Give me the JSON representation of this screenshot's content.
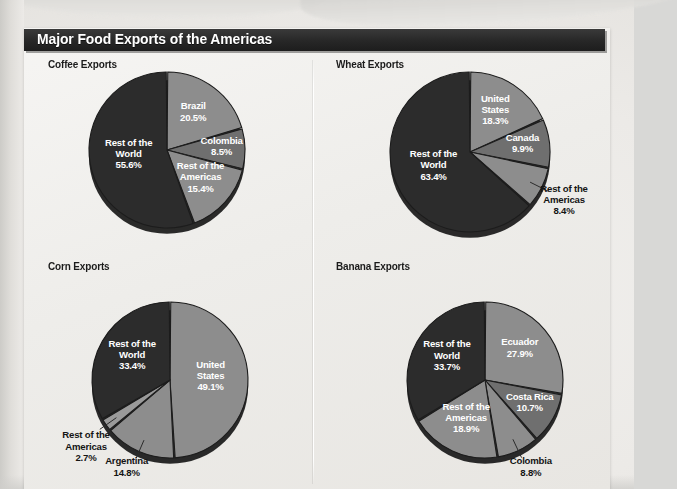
{
  "figure": {
    "title": "Major Food Exports of the Americas"
  },
  "palette": {
    "dark_slice": "#2c2c2c",
    "mid_slice": "#6f6f6f",
    "light_slice": "#8d8d8d",
    "lighter_slice": "#9a9a9a",
    "slice_edge": "#1c1c1c",
    "label_inside": "#ffffff",
    "label_outside": "#141414",
    "title_bar_bg": "#272727",
    "title_bar_text": "#ffffff",
    "paper_bg": "#efedea"
  },
  "chart_data": [
    {
      "id": "coffee",
      "type": "pie",
      "title": "Coffee Exports",
      "unit": "percent",
      "start_angle": 0,
      "categories": [
        "Brazil",
        "Colombia",
        "Rest of the Americas",
        "Rest of the World"
      ],
      "values": [
        20.5,
        8.5,
        15.4,
        55.6
      ],
      "labels": [
        "Brazil\n20.5%",
        "Colombia\n8.5%",
        "Rest of the\nAmericas\n15.4%",
        "Rest of the\nWorld\n55.6%"
      ],
      "slices": [
        {
          "name": "Brazil",
          "value": 20.5,
          "label": "Brazil",
          "pct": "20.5%",
          "color": "#8d8d8d",
          "label_pos": "inside",
          "label_r": 0.56
        },
        {
          "name": "Colombia",
          "value": 8.5,
          "label": "Colombia",
          "pct": "8.5%",
          "color": "#6f6f6f",
          "label_pos": "inside",
          "label_r": 0.7
        },
        {
          "name": "Rest of the Americas",
          "value": 15.4,
          "label": "Rest of the\nAmericas",
          "pct": "15.4%",
          "color": "#8d8d8d",
          "label_pos": "inside",
          "label_r": 0.58
        },
        {
          "name": "Rest of the World",
          "value": 55.6,
          "label": "Rest of the\nWorld",
          "pct": "55.6%",
          "color": "#2c2c2c",
          "label_pos": "inside",
          "label_r": 0.5
        }
      ]
    },
    {
      "id": "wheat",
      "type": "pie",
      "title": "Wheat Exports",
      "unit": "percent",
      "start_angle": 0,
      "categories": [
        "United States",
        "Canada",
        "Rest of the Americas",
        "Rest of the World"
      ],
      "values": [
        18.3,
        9.9,
        8.4,
        63.4
      ],
      "labels": [
        "United\nStates\n18.3%",
        "Canada\n9.9%",
        "Rest of the\nAmericas\n8.4%",
        "Rest of the\nWorld\n63.4%"
      ],
      "slices": [
        {
          "name": "United States",
          "value": 18.3,
          "label": "United\nStates",
          "pct": "18.3%",
          "color": "#8d8d8d",
          "label_pos": "inside",
          "label_r": 0.58
        },
        {
          "name": "Canada",
          "value": 9.9,
          "label": "Canada",
          "pct": "9.9%",
          "color": "#6f6f6f",
          "label_pos": "inside",
          "label_r": 0.66
        },
        {
          "name": "Rest of the Americas",
          "value": 8.4,
          "label": "Rest of the\nAmericas",
          "pct": "8.4%",
          "color": "#8d8d8d",
          "label_pos": "outside",
          "label_r": 1.42,
          "leader": true
        },
        {
          "name": "Rest of the World",
          "value": 63.4,
          "label": "Rest of the\nWorld",
          "pct": "63.4%",
          "color": "#2c2c2c",
          "label_pos": "inside",
          "label_r": 0.5
        }
      ]
    },
    {
      "id": "corn",
      "type": "pie",
      "title": "Corn Exports",
      "unit": "percent",
      "start_angle": 0,
      "categories": [
        "United States",
        "Argentina",
        "Rest of the Americas",
        "Rest of the World"
      ],
      "values": [
        49.1,
        14.8,
        2.7,
        33.4
      ],
      "labels": [
        "United\nStates\n49.1%",
        "Argentina\n14.8%",
        "Rest of the\nAmericas\n2.7%",
        "Rest of the\nWorld\n33.4%"
      ],
      "slices": [
        {
          "name": "United States",
          "value": 49.1,
          "label": "United\nStates",
          "pct": "49.1%",
          "color": "#8d8d8d",
          "label_pos": "inside",
          "label_r": 0.52
        },
        {
          "name": "Argentina",
          "value": 14.8,
          "label": "Argentina",
          "pct": "14.8%",
          "color": "#8d8d8d",
          "label_pos": "outside",
          "label_r": 1.4,
          "leader": true
        },
        {
          "name": "Rest of the Americas",
          "value": 2.7,
          "label": "Rest of the\nAmericas",
          "pct": "2.7%",
          "color": "#9a9a9a",
          "label_pos": "outside",
          "label_r": 1.55,
          "leader": true
        },
        {
          "name": "Rest of the World",
          "value": 33.4,
          "label": "Rest of the\nWorld",
          "pct": "33.4%",
          "color": "#2c2c2c",
          "label_pos": "inside",
          "label_r": 0.56
        }
      ]
    },
    {
      "id": "banana",
      "type": "pie",
      "title": "Banana Exports",
      "unit": "percent",
      "start_angle": 0,
      "categories": [
        "Ecuador",
        "Costa Rica",
        "Colombia",
        "Rest of the Americas",
        "Rest of the World"
      ],
      "values": [
        27.9,
        10.7,
        8.8,
        18.9,
        33.7
      ],
      "labels": [
        "Ecuador\n27.9%",
        "Costa Rica\n10.7%",
        "Colombia\n8.8%",
        "Rest of the\nAmericas\n18.9%",
        "Rest of the\nWorld\n33.7%"
      ],
      "slices": [
        {
          "name": "Ecuador",
          "value": 27.9,
          "label": "Ecuador",
          "pct": "27.9%",
          "color": "#8d8d8d",
          "label_pos": "inside",
          "label_r": 0.58
        },
        {
          "name": "Costa Rica",
          "value": 10.7,
          "label": "Costa Rica",
          "pct": "10.7%",
          "color": "#6f6f6f",
          "label_pos": "inside",
          "label_r": 0.66
        },
        {
          "name": "Colombia",
          "value": 8.8,
          "label": "Colombia",
          "pct": "8.8%",
          "color": "#8d8d8d",
          "label_pos": "outside",
          "label_r": 1.38,
          "leader": true
        },
        {
          "name": "Rest of the Americas",
          "value": 18.9,
          "label": "Rest of the\nAmericas",
          "pct": "18.9%",
          "color": "#8d8d8d",
          "label_pos": "inside",
          "label_r": 0.58
        },
        {
          "name": "Rest of the World",
          "value": 33.7,
          "label": "Rest of the\nWorld",
          "pct": "33.7%",
          "color": "#2c2c2c",
          "label_pos": "inside",
          "label_r": 0.56
        }
      ]
    }
  ],
  "panels": [
    {
      "id": "coffee",
      "x": 16,
      "y": 30,
      "pie_cx": 143,
      "pie_cy": 122,
      "pie_r": 78
    },
    {
      "id": "wheat",
      "x": 304,
      "y": 30,
      "pie_cx": 446,
      "pie_cy": 124,
      "pie_r": 80
    },
    {
      "id": "corn",
      "x": 16,
      "y": 232,
      "pie_cx": 146,
      "pie_cy": 352,
      "pie_r": 78
    },
    {
      "id": "banana",
      "x": 304,
      "y": 232,
      "pie_cx": 461,
      "pie_cy": 352,
      "pie_r": 78
    }
  ]
}
